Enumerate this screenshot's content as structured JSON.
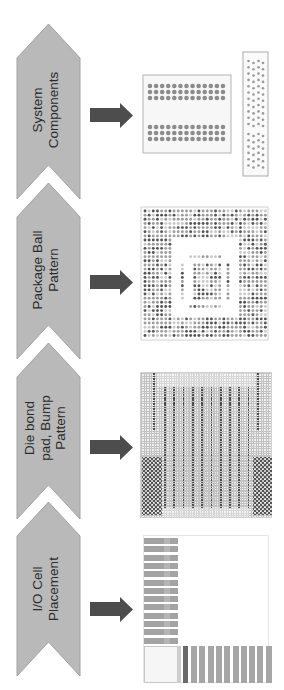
{
  "figure": {
    "colors": {
      "background": "#ffffff",
      "chevron_fill": "#b9b9b9",
      "chevron_stroke": "#a2a2a2",
      "arrow": "#4d4d4d",
      "text": "#2b2b2b",
      "dot_dark": "#555555",
      "dot_mid": "#9c9c9c",
      "dot_light": "#c9c9c9"
    },
    "steps": [
      {
        "id": "system-components",
        "label_lines": [
          "System",
          "Components"
        ]
      },
      {
        "id": "package-ball-pattern",
        "label_lines": [
          "Package Ball",
          "Pattern"
        ]
      },
      {
        "id": "die-bond-pad-bump-pattern",
        "label_lines": [
          "Die bond",
          "pad, Bump",
          "Pattern"
        ]
      },
      {
        "id": "io-cell-placement",
        "label_lines": [
          "I/O Cell",
          "Placement"
        ]
      }
    ]
  },
  "diagrams": {
    "system_components": {
      "board": {
        "groups": 2,
        "rows_per_group": 3,
        "cols": 13
      },
      "connector": {
        "cols": 4,
        "upper_rows": 11,
        "lower_rows": 6
      }
    },
    "package_ball_pattern": {
      "cols": 30,
      "rows": 31,
      "outer_ring": {
        "top": 7,
        "bottom": 5,
        "left": 7,
        "right": 7
      },
      "inner_top_row": 11,
      "inner_bottom_row": 23,
      "inner_side_cols": [
        9,
        20
      ],
      "inner_block": {
        "col_start": 12,
        "col_end": 18,
        "row_start": 13,
        "row_end": 21
      }
    },
    "die_bond_pad": {
      "bump_stripes": 10,
      "edge_columns": 2
    },
    "io_cell_placement": {
      "side_cells": 13,
      "bottom_cells": 10
    }
  }
}
